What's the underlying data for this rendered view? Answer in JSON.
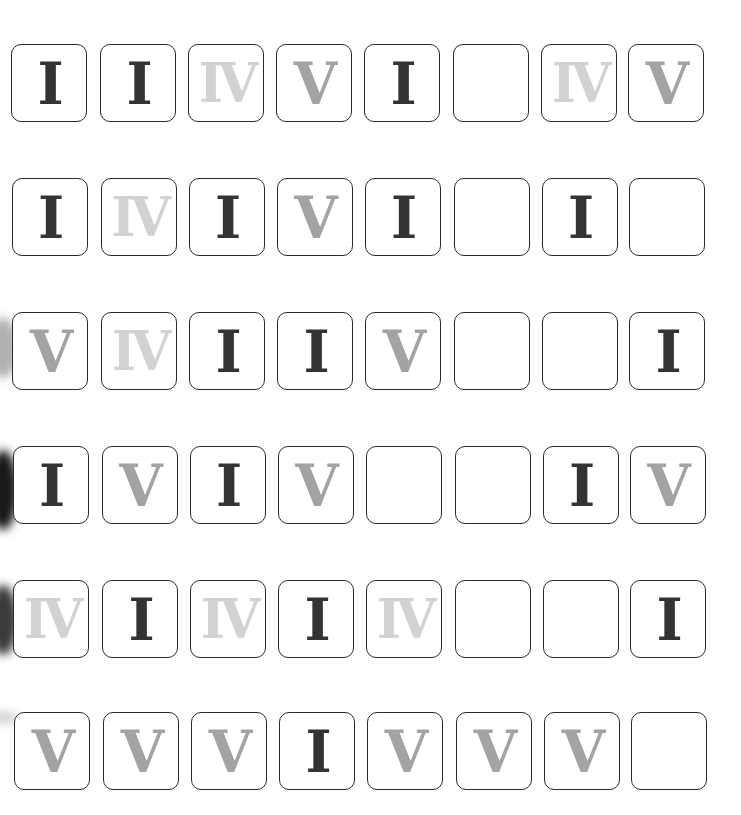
{
  "colors": {
    "background": "#ffffff",
    "tile_border": "#2a2a2a",
    "numeral_I": "#333333",
    "numeral_V": "#a3a3a3",
    "numeral_IV": "#d2d2d2"
  },
  "grid": {
    "rows": 6,
    "columns": 8,
    "cells": [
      [
        "I",
        "I",
        "IV",
        "V",
        "I",
        "",
        "IV",
        "V"
      ],
      [
        "I",
        "IV",
        "I",
        "V",
        "I",
        "",
        "I",
        ""
      ],
      [
        "V",
        "IV",
        "I",
        "I",
        "V",
        "",
        "",
        "I"
      ],
      [
        "I",
        "V",
        "I",
        "V",
        "",
        "",
        "I",
        "V"
      ],
      [
        "IV",
        "I",
        "IV",
        "I",
        "IV",
        "",
        "",
        "I"
      ],
      [
        "V",
        "V",
        "V",
        "I",
        "V",
        "V",
        "V",
        ""
      ]
    ]
  }
}
